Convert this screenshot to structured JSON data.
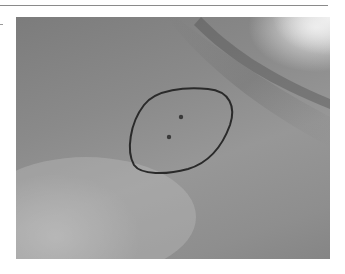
{
  "figure": {
    "description": "Grayscale clinical photograph of skin with a hand-drawn oval outline marking an area containing two small dark puncture-like dots",
    "colors": {
      "rule": "#8a8a8a",
      "skin_dark": "#7c7c7c",
      "skin_light": "#bdbdbd",
      "highlight": "#ebebeb",
      "outline": "#2a2a2a"
    },
    "annotations": [
      {
        "type": "outline",
        "shape": "oval",
        "label": "marked-area"
      },
      {
        "type": "dot",
        "label": "puncture-mark-1"
      },
      {
        "type": "dot",
        "label": "puncture-mark-2"
      }
    ]
  }
}
